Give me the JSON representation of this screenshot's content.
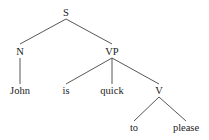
{
  "tree": {
    "nodes": [
      {
        "id": "S",
        "label": "S",
        "x": 66,
        "y": 13
      },
      {
        "id": "N",
        "label": "N",
        "x": 20,
        "y": 52
      },
      {
        "id": "VP",
        "label": "VP",
        "x": 112,
        "y": 52
      },
      {
        "id": "John",
        "label": "John",
        "x": 20,
        "y": 91
      },
      {
        "id": "is",
        "label": "is",
        "x": 66,
        "y": 91
      },
      {
        "id": "quick",
        "label": "quick",
        "x": 112,
        "y": 91
      },
      {
        "id": "V",
        "label": "V",
        "x": 159,
        "y": 91
      },
      {
        "id": "to",
        "label": "to",
        "x": 134,
        "y": 128
      },
      {
        "id": "please",
        "label": "please",
        "x": 186,
        "y": 128
      }
    ],
    "edges": [
      [
        "S",
        "N"
      ],
      [
        "S",
        "VP"
      ],
      [
        "N",
        "John"
      ],
      [
        "VP",
        "is"
      ],
      [
        "VP",
        "quick"
      ],
      [
        "VP",
        "V"
      ],
      [
        "V",
        "to"
      ],
      [
        "V",
        "please"
      ]
    ]
  }
}
